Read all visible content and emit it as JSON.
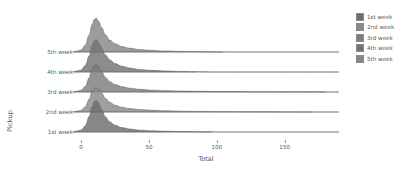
{
  "chart_data": {
    "type": "area",
    "title": "",
    "subtitle": "",
    "xlabel": "Total",
    "ylabel": "Pickup",
    "xlim": [
      -6,
      190
    ],
    "xticks": [
      0,
      50,
      100,
      150
    ],
    "xticklabels": [
      "0",
      "50",
      "100",
      "150"
    ],
    "grid": false,
    "legend_position": "right",
    "categories": [
      "1st week",
      "2nd week",
      "3rd week",
      "4th week",
      "5th week"
    ],
    "series": [
      {
        "name": "1st week",
        "row_from_bottom": 1,
        "color": "#6d6d6d",
        "peak_x": 11,
        "peak_height": 0.93,
        "tail_end_x": 97,
        "density_x": [
          0,
          3,
          6,
          8,
          10,
          11,
          13,
          15,
          18,
          21,
          25,
          30,
          36,
          43,
          52,
          62,
          74,
          86,
          97,
          115,
          150,
          190
        ],
        "density_y": [
          0.06,
          0.18,
          0.46,
          0.74,
          0.9,
          0.93,
          0.84,
          0.66,
          0.44,
          0.3,
          0.2,
          0.13,
          0.085,
          0.055,
          0.035,
          0.022,
          0.013,
          0.007,
          0.003,
          0.0,
          0.0,
          0.0
        ]
      },
      {
        "name": "2nd week",
        "row_from_bottom": 2,
        "color": "#8a8a8a",
        "peak_x": 11,
        "peak_height": 0.72,
        "tail_end_x": 170,
        "density_x": [
          0,
          3,
          6,
          8,
          10,
          11,
          13,
          15,
          18,
          21,
          25,
          30,
          36,
          43,
          52,
          62,
          74,
          88,
          105,
          125,
          148,
          170,
          190
        ],
        "density_y": [
          0.05,
          0.15,
          0.38,
          0.6,
          0.7,
          0.72,
          0.67,
          0.56,
          0.4,
          0.29,
          0.2,
          0.14,
          0.1,
          0.07,
          0.05,
          0.035,
          0.024,
          0.016,
          0.01,
          0.006,
          0.003,
          0.001,
          0.0
        ]
      },
      {
        "name": "3rd week",
        "row_from_bottom": 3,
        "color": "#7d7d7d",
        "peak_x": 11,
        "peak_height": 0.8,
        "tail_end_x": 180,
        "density_x": [
          0,
          3,
          6,
          8,
          10,
          11,
          13,
          15,
          18,
          21,
          25,
          30,
          36,
          43,
          52,
          62,
          74,
          88,
          105,
          125,
          150,
          180,
          190
        ],
        "density_y": [
          0.05,
          0.16,
          0.42,
          0.66,
          0.78,
          0.8,
          0.73,
          0.6,
          0.43,
          0.31,
          0.22,
          0.155,
          0.11,
          0.078,
          0.055,
          0.04,
          0.028,
          0.019,
          0.012,
          0.007,
          0.004,
          0.001,
          0.0
        ]
      },
      {
        "name": "4th week",
        "row_from_bottom": 4,
        "color": "#737373",
        "peak_x": 11,
        "peak_height": 0.95,
        "tail_end_x": 84,
        "density_x": [
          0,
          3,
          6,
          8,
          10,
          11,
          13,
          15,
          18,
          21,
          25,
          30,
          36,
          43,
          52,
          62,
          74,
          84,
          100,
          140,
          190
        ],
        "density_y": [
          0.06,
          0.19,
          0.48,
          0.77,
          0.92,
          0.95,
          0.86,
          0.7,
          0.5,
          0.36,
          0.25,
          0.17,
          0.115,
          0.075,
          0.048,
          0.03,
          0.016,
          0.006,
          0.0,
          0.0,
          0.0
        ]
      },
      {
        "name": "5th week",
        "row_from_bottom": 5,
        "color": "#868686",
        "peak_x": 11,
        "peak_height": 1.0,
        "tail_end_x": 104,
        "density_x": [
          0,
          3,
          6,
          8,
          10,
          11,
          13,
          15,
          18,
          21,
          25,
          30,
          36,
          43,
          52,
          62,
          74,
          88,
          104,
          130,
          190
        ],
        "density_y": [
          0.06,
          0.2,
          0.5,
          0.81,
          0.97,
          1.0,
          0.9,
          0.72,
          0.5,
          0.35,
          0.24,
          0.16,
          0.108,
          0.072,
          0.047,
          0.03,
          0.018,
          0.009,
          0.003,
          0.0,
          0.0
        ]
      }
    ]
  },
  "axes": {
    "ylabel": "Pickup",
    "xlabel": "Total",
    "yticks": [
      "5th week",
      "4th week",
      "3rd week",
      "2nd week",
      "1st week"
    ],
    "xticklabels": [
      "0",
      "50",
      "100",
      "150"
    ]
  },
  "legend": {
    "items": [
      {
        "label": "1st week",
        "color": "#6d6d6d"
      },
      {
        "label": "2nd week",
        "color": "#8a8a8a"
      },
      {
        "label": "3rd week",
        "color": "#7d7d7d"
      },
      {
        "label": "4th week",
        "color": "#737373"
      },
      {
        "label": "5th week",
        "color": "#868686"
      }
    ]
  }
}
